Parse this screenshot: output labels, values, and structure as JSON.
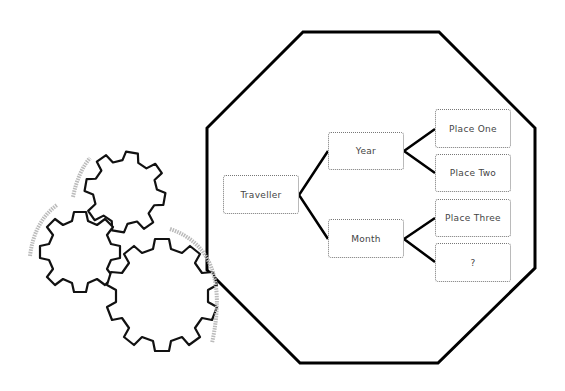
{
  "diagram": {
    "root": {
      "label": "Traveller"
    },
    "branches": [
      {
        "label": "Year",
        "children": [
          {
            "label": "Place One"
          },
          {
            "label": "Place Two"
          }
        ]
      },
      {
        "label": "Month",
        "children": [
          {
            "label": "Place Three"
          },
          {
            "label": "?"
          }
        ]
      }
    ],
    "decorations": [
      "gears-icon",
      "octagon-frame"
    ],
    "colors": {
      "line": "#000000",
      "node_border": "#777777",
      "arc": "#bbbbbb"
    }
  }
}
